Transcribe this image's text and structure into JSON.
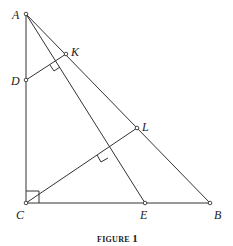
{
  "figure": {
    "caption_word": "FIGURE",
    "caption_number": "1",
    "points": {
      "A": {
        "label": "A",
        "x": 26,
        "y": 14
      },
      "D": {
        "label": "D",
        "x": 26,
        "y": 80
      },
      "K": {
        "label": "K",
        "x": 66,
        "y": 54
      },
      "L": {
        "label": "L",
        "x": 137,
        "y": 128
      },
      "C": {
        "label": "C",
        "x": 26,
        "y": 203
      },
      "E": {
        "label": "E",
        "x": 145,
        "y": 203
      },
      "B": {
        "label": "B",
        "x": 210,
        "y": 203
      }
    },
    "segments": [
      "AC",
      "CB",
      "AB",
      "AE",
      "DK",
      "CL"
    ],
    "right_angles": [
      "C (ACB)",
      "DK ⟂ AE",
      "CL ⟂ AE"
    ]
  }
}
